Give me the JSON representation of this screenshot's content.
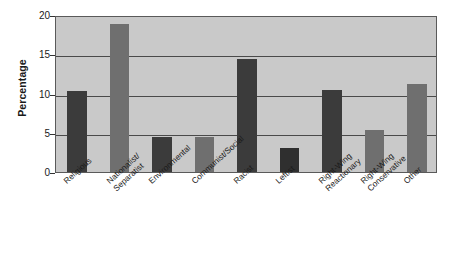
{
  "chart_data": {
    "type": "bar",
    "title": "",
    "subtitle": "",
    "xlabel": "",
    "ylabel": "Percentage",
    "ylim": [
      0,
      20
    ],
    "yticks": [
      0,
      5,
      10,
      15,
      20
    ],
    "ytick_labels": [
      "0",
      "5",
      "10",
      "15",
      "20"
    ],
    "grid": true,
    "legend": "none",
    "categories": [
      "Religious",
      "Nationalist/Separatist",
      "Environmental",
      "Communist/Social",
      "Racist",
      "Leftist",
      "Right-Wing Reactionary",
      "Right-Wing Conservative",
      "Other"
    ],
    "category_lines": [
      [
        "Religious",
        ""
      ],
      [
        "Nationalist/",
        "Separatist"
      ],
      [
        "Environmental",
        ""
      ],
      [
        "Communist/Social",
        ""
      ],
      [
        "Racist",
        ""
      ],
      [
        "Leftist",
        ""
      ],
      [
        "Right-Wing",
        "Reactionary"
      ],
      [
        "Right-Wing",
        "Conservative"
      ],
      [
        "Other",
        ""
      ]
    ],
    "values": [
      10.3,
      18.9,
      4.5,
      4.4,
      14.4,
      3.1,
      10.5,
      5.3,
      11.2
    ],
    "bar_colors": [
      "#3b3b3b",
      "#6f6f6f",
      "#3b3b3b",
      "#6f6f6f",
      "#3b3b3b",
      "#2f2f2f",
      "#3b3b3b",
      "#6f6f6f",
      "#6f6f6f"
    ]
  },
  "style": {
    "plot_background": "#c9c9c9",
    "gridline_color": "#4a4a4a",
    "axis_color": "#5a5a5a",
    "text_color": "#1a1a1a",
    "page_background": "#ffffff"
  }
}
